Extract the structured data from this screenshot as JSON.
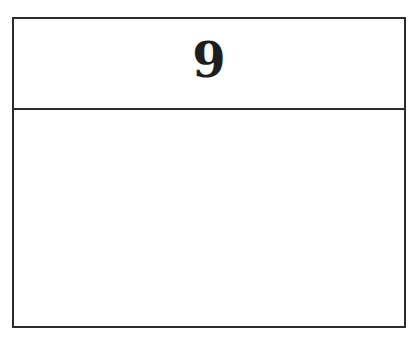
{
  "card": {
    "header": {
      "number": "9"
    },
    "body": {
      "content": ""
    }
  }
}
